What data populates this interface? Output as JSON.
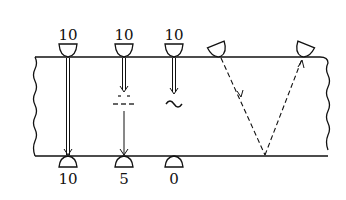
{
  "diagram": {
    "type": "ultrasonic-testing-schematic",
    "colors": {
      "line": "#111111",
      "background": "#ffffff"
    },
    "top_labels": [
      "10",
      "10",
      "10"
    ],
    "bottom_labels": [
      "10",
      "5",
      "0"
    ],
    "probes": [
      {
        "id": "probe-1",
        "top_label": "10",
        "bottom_label": "10",
        "defect": "none"
      },
      {
        "id": "probe-2",
        "top_label": "10",
        "bottom_label": "5",
        "defect": "lamination-dashes"
      },
      {
        "id": "probe-3",
        "top_label": "10",
        "bottom_label": "0",
        "defect": "wave-attenuation"
      }
    ],
    "angle_beam": {
      "path": "dashed-v-reflection"
    }
  }
}
